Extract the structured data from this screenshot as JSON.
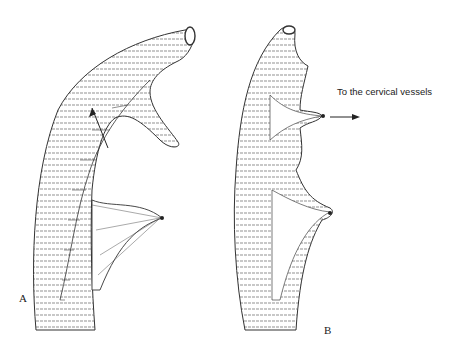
{
  "figure": {
    "panels": [
      {
        "id": "A",
        "label": "A",
        "description": "Intestinal segment (jejunal loop) with mesenteric vascular pedicle; arrow indicates direction of mobilization"
      },
      {
        "id": "B",
        "label": "B",
        "description": "Isolated segment with vascular pedicle directed toward the cervical vessels"
      }
    ],
    "annotations": {
      "pedicle_note": "To the cervical vessels"
    },
    "caption": {
      "text": "",
      "note": "caption cut off at bottom edge; illegible"
    },
    "colors": {
      "ink": "#222222",
      "background": "#ffffff"
    }
  }
}
